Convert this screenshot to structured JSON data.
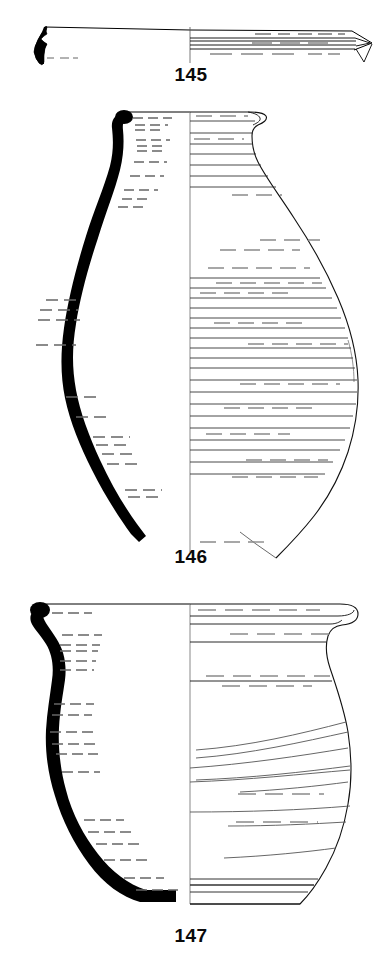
{
  "plate": {
    "type": "archaeological-pottery-illustration",
    "background_color": "#ffffff",
    "ink_color": "#000000",
    "hatch_color": "#555555",
    "width": 382,
    "height": 962,
    "figure_count": 3
  },
  "figures": [
    {
      "id": "145",
      "caption": "145",
      "description": "Flat everted rim / lid profile sherd, shallow horizontal form",
      "profile_fill": "#000000",
      "centerline_x": 190,
      "orientation": "horizontal-flat",
      "rim_style": "hooked-flat-rim",
      "decoration": "horizontal striations",
      "band_count": 4
    },
    {
      "id": "146",
      "caption": "146",
      "description": "Tall ovoid amphora with everted rim, narrow neck, rounded shoulder and tapering pointed base",
      "profile_fill": "#000000",
      "centerline_x": 190,
      "orientation": "vertical",
      "rim_style": "everted-flaring-rim",
      "decoration": "dense horizontal ribbing / combed bands",
      "band_count": 28,
      "max_width_x": 358
    },
    {
      "id": "147",
      "caption": "147",
      "description": "Wide-mouthed globular jar with thickened rolled rim and rounded base",
      "profile_fill": "#000000",
      "centerline_x": 190,
      "orientation": "vertical",
      "rim_style": "thickened-rolled-rim",
      "decoration": "horizontal wheel-turning grooves and striations",
      "band_count": 16,
      "max_width_x": 352
    }
  ],
  "captions": {
    "c145": "145",
    "c146": "146",
    "c147": "147"
  }
}
